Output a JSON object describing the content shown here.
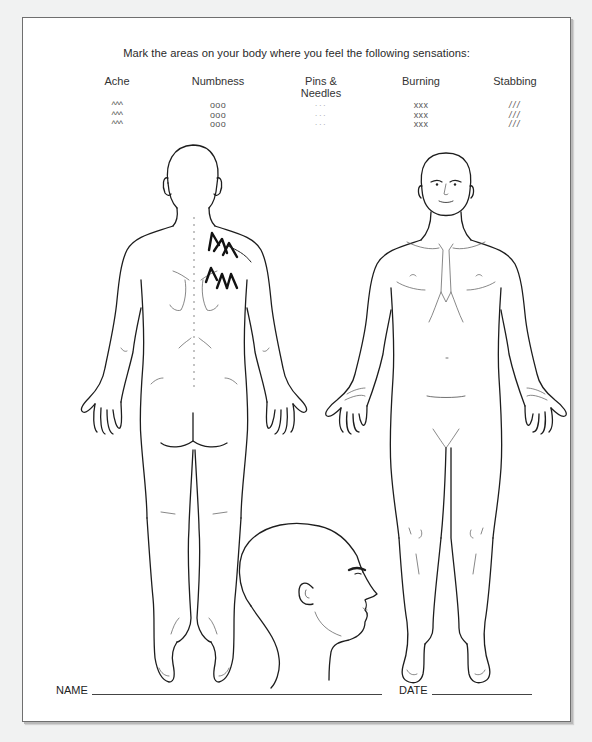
{
  "form": {
    "instructions": "Mark the areas on your body where you feel the following sensations:",
    "legend": [
      {
        "label": "Ache",
        "symbol": "^^^",
        "rows": [
          "^^^",
          "^^^",
          "^^^"
        ]
      },
      {
        "label": "Numbness",
        "symbol": "ooo",
        "rows": [
          "ooo",
          "ooo",
          "ooo"
        ]
      },
      {
        "label": "Pins & Needles",
        "label_line1": "Pins &",
        "label_line2": "Needles",
        "symbol": "···",
        "rows": [
          "···",
          "···",
          "···"
        ]
      },
      {
        "label": "Burning",
        "symbol": "xxx",
        "rows": [
          "xxx",
          "xxx",
          "xxx"
        ]
      },
      {
        "label": "Stabbing",
        "symbol": "///",
        "rows": [
          "///",
          "///",
          "///"
        ]
      }
    ],
    "figures": {
      "back_view": {
        "marks": [
          {
            "type": "Ache",
            "symbol": "^^^",
            "location": "right neck / upper trapezius"
          },
          {
            "type": "Ache",
            "symbol": "^^^",
            "location": "right upper back / scapula"
          }
        ]
      },
      "front_view": {
        "marks": []
      },
      "side_head_view": {
        "marks": []
      }
    },
    "fields": {
      "name_label": "NAME",
      "name_value": "",
      "date_label": "DATE",
      "date_value": ""
    }
  },
  "colors": {
    "page_background": "#f1f2f2",
    "sheet_background": "#ffffff",
    "border": "#6f6f6f",
    "line_art": "#1d1d1d",
    "marker": "#111111"
  }
}
